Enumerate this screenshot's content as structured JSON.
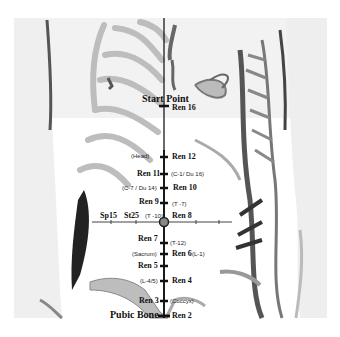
{
  "figure": {
    "title_points": {
      "start": "Start Point",
      "end": "Pubic Bone"
    },
    "meridian": "Ren",
    "points": [
      {
        "id": "ren16",
        "label": "Ren 16",
        "y": 108,
        "side": "right",
        "note": null
      },
      {
        "id": "ren12",
        "label": "Ren 12",
        "y": 157,
        "side": "right",
        "note": "(Head)",
        "note_side": "left"
      },
      {
        "id": "ren11",
        "label": "Ren 11",
        "y": 174,
        "side": "left",
        "note": "(C-1/ Du 16)",
        "note_side": "right"
      },
      {
        "id": "ren10",
        "label": "Ren 10",
        "y": 188,
        "side": "right",
        "note": "(C-7 / Du 14)",
        "note_side": "left"
      },
      {
        "id": "ren9",
        "label": "Ren 9",
        "y": 203,
        "side": "left",
        "note": "(T -7)",
        "note_side": "right"
      },
      {
        "id": "ren8",
        "label": "Ren 8",
        "y": 222,
        "side": "right",
        "note": "(T -10)",
        "note_side": "left"
      },
      {
        "id": "ren7",
        "label": "Ren 7",
        "y": 243,
        "side": "left",
        "note": "(T-12)",
        "note_side": "right"
      },
      {
        "id": "ren6",
        "label": "Ren 6",
        "y": 254,
        "side": "right",
        "note": "(Sacrum)",
        "note_side": "left",
        "note2": "(L-1)"
      },
      {
        "id": "ren5",
        "label": "Ren 5",
        "y": 266,
        "side": "left",
        "note": null
      },
      {
        "id": "ren4",
        "label": "Ren 4",
        "y": 281,
        "side": "right",
        "note": "(L-4/5)",
        "note_side": "left"
      },
      {
        "id": "ren3",
        "label": "Ren 3",
        "y": 301,
        "side": "left",
        "note": "(Coccyx)",
        "note_side": "right"
      },
      {
        "id": "ren2",
        "label": "Ren 2",
        "y": 316,
        "side": "right",
        "note": null
      }
    ],
    "horizontal_points": [
      {
        "id": "sp15",
        "label": "Sp15"
      },
      {
        "id": "st25",
        "label": "St25"
      }
    ],
    "colors": {
      "line": "#1a1a1a",
      "center_marker": "#888888",
      "bone": "#cccccc",
      "muscle": "#555555",
      "background": "#ffffff"
    }
  }
}
